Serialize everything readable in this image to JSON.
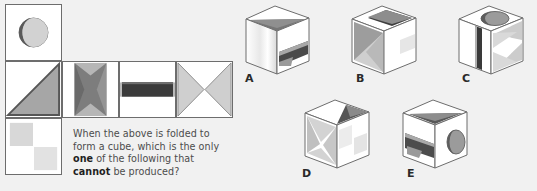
{
  "question": {
    "line1_pre": "When the above is folded to form a",
    "line2_pre": "cube, which is the only ",
    "line2_bold": "one",
    "line2_post": " of the",
    "line3_pre": "following that ",
    "line3_bold": "cannot",
    "line3_post": " be produced?",
    "full_text": "When the above is folded to form a cube, which is the only one of the following that cannot be produced?"
  },
  "net": {
    "description": "Cube net, six square faces arranged in a T/cross shape",
    "faces": [
      {
        "id": "moon",
        "label": "moon-face",
        "pattern": "circle with crescent",
        "position": "top-left"
      },
      {
        "id": "tri",
        "label": "triangle-face",
        "pattern": "right triangle lower-right",
        "position": "middle-row-col1"
      },
      {
        "id": "bow",
        "label": "bowtie-face",
        "pattern": "vertical bowtie / hourglass",
        "position": "middle-row-col2"
      },
      {
        "id": "band",
        "label": "band-face",
        "pattern": "horizontal dark band",
        "position": "middle-row-col3"
      },
      {
        "id": "hour",
        "label": "hourglass-face",
        "pattern": "two triangles facing inward",
        "position": "middle-row-col4"
      },
      {
        "id": "check",
        "label": "checkerboard-face",
        "pattern": "two light squares diagonal",
        "position": "bottom-left"
      }
    ]
  },
  "options": [
    {
      "id": "a",
      "label": "A",
      "top": "dark-triangle",
      "left": "light-gradient",
      "right": "dark-band"
    },
    {
      "id": "b",
      "label": "B",
      "top": "dark-band",
      "left": "bowtie",
      "right": "light-checker"
    },
    {
      "id": "c",
      "label": "C",
      "top": "moon-circle",
      "left": "vertical-band",
      "right": "hourglass"
    },
    {
      "id": "d",
      "label": "D",
      "top": "dark-triangle",
      "left": "bowtie",
      "right": "checkerboard"
    },
    {
      "id": "e",
      "label": "E",
      "top": "dark-triangle",
      "left": "dark-band",
      "right": "moon-circle"
    }
  ],
  "colors": {
    "background": "#f1f1f1",
    "face_fill": "#ffffff",
    "stroke": "#6d6d6d",
    "dark": "#3a3a3a",
    "mid": "#8d8d8d",
    "light": "#c9c9c9",
    "pale": "#e2e2e2",
    "text": "#4c4c4c",
    "text_bold": "#1f1f1f"
  }
}
